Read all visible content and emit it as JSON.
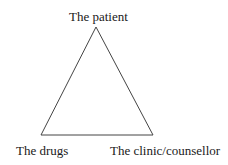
{
  "diagram": {
    "type": "triangle",
    "line_color": "#444444",
    "vertices": {
      "top": {
        "label": "The patient",
        "x": 96,
        "y": 27
      },
      "bottom_left": {
        "label": "The drugs",
        "x": 41,
        "y": 135
      },
      "bottom_right": {
        "label": "The clinic/counsellor",
        "x": 153,
        "y": 135
      }
    }
  }
}
